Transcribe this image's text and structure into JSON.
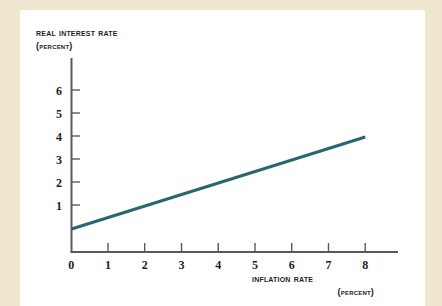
{
  "background": {
    "page_color": "#efe7cf",
    "card_color": "#ffffff"
  },
  "chart_data": {
    "type": "line",
    "title": "",
    "xlabel": "Inflation rate",
    "xlabel_units": "(percent)",
    "ylabel": "Real interest rate",
    "ylabel_units": "(percent)",
    "xlim": [
      0,
      8.6
    ],
    "ylim": [
      0,
      6.8
    ],
    "xticks": [
      0,
      1,
      2,
      3,
      4,
      5,
      6,
      7,
      8
    ],
    "yticks": [
      1,
      2,
      3,
      4,
      5,
      6
    ],
    "xtick_labels": [
      "0",
      "1",
      "2",
      "3",
      "4",
      "5",
      "6",
      "7",
      "8"
    ],
    "ytick_labels": [
      "1",
      "2",
      "3",
      "4",
      "5",
      "6"
    ],
    "grid": false,
    "legend": "none",
    "series": [
      {
        "name": "Real interest rate",
        "color": "#2a6670",
        "x": [
          0,
          8
        ],
        "y": [
          1,
          5
        ],
        "points": [
          {
            "x": 0,
            "y": 1
          },
          {
            "x": 8,
            "y": 5
          }
        ]
      }
    ],
    "annotations": []
  },
  "axes": {
    "y_title": "Real interest rate",
    "y_units": "(percent)",
    "x_title": "Inflation rate",
    "x_units": "(percent)"
  },
  "ticks": {
    "y": [
      "6",
      "5",
      "4",
      "3",
      "2",
      "1"
    ],
    "x": [
      "0",
      "1",
      "2",
      "3",
      "4",
      "5",
      "6",
      "7",
      "8"
    ]
  },
  "colors": {
    "line": "#2a6670",
    "axis": "#5a5a58",
    "text": "#211f1d"
  }
}
